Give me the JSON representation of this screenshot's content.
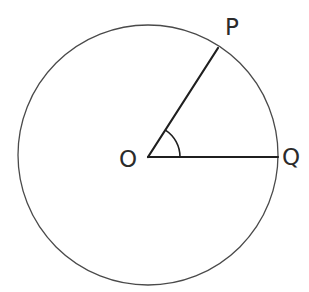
{
  "figure": {
    "kind": "geometry-diagram",
    "canvas": {
      "width": 309,
      "height": 292,
      "background": "#ffffff"
    },
    "stroke_colors": {
      "circle": "#4a4a4a",
      "radius": "#1f1f1f",
      "angle_arc": "#1f1f1f"
    },
    "label_color": "#2b2b2b"
  },
  "circle": {
    "name": "circle-outline",
    "center": {
      "x": 148,
      "y": 155
    },
    "radius": 130,
    "stroke_width": 1.3
  },
  "center_point": {
    "name": "center-O",
    "label": "O",
    "x": 148,
    "y": 157
  },
  "radii": [
    {
      "name": "radius-OP",
      "label": "OP",
      "from": {
        "x": 148,
        "y": 157
      },
      "to": {
        "x": 218,
        "y": 48
      },
      "endpoint_label": "P",
      "angle_degrees": 57,
      "stroke_width": 2.2
    },
    {
      "name": "radius-OQ",
      "label": "OQ",
      "from": {
        "x": 148,
        "y": 157
      },
      "to": {
        "x": 278,
        "y": 157
      },
      "endpoint_label": "Q",
      "angle_degrees": 0,
      "stroke_width": 2.2
    }
  ],
  "angle_marker": {
    "name": "angle-arc-POQ",
    "vertex": {
      "x": 148,
      "y": 157
    },
    "radius": 32,
    "start_angle_degrees": 0,
    "end_angle_degrees": 57,
    "stroke_width": 1.6,
    "measure_label": ""
  },
  "labels": {
    "center": "O",
    "point_p": "P",
    "point_q": "Q"
  }
}
